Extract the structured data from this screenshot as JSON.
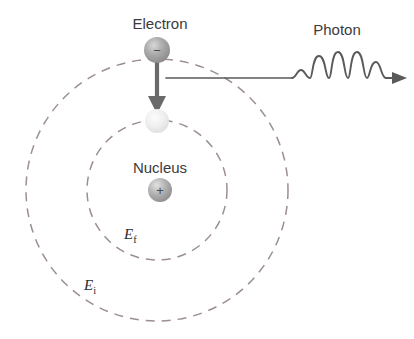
{
  "diagram": {
    "background_color": "#ffffff",
    "orbit_color": "#9c8d97",
    "line_color": "#5a5a5a",
    "text_color": "#3b3b3b",
    "labels": {
      "electron": "Electron",
      "photon": "Photon",
      "nucleus": "Nucleus",
      "energy_final": "E",
      "energy_final_sub": "f",
      "energy_initial": "E",
      "energy_initial_sub": "i"
    },
    "particles": {
      "electron_charge": "−",
      "nucleus_charge": "+"
    },
    "orbits": [
      {
        "name": "initial-orbit",
        "label": "Ei",
        "cx": 157,
        "cy": 190,
        "r": 131
      },
      {
        "name": "final-orbit",
        "label": "Ef",
        "cx": 157,
        "cy": 190,
        "r": 70
      }
    ],
    "geometry": {
      "electron_x": 157,
      "electron_y": 50,
      "electron_r": 13,
      "landing_x": 157,
      "landing_y": 121,
      "landing_r": 12,
      "nucleus_x": 160,
      "nucleus_y": 190,
      "nucleus_r": 12,
      "transition_arrow_from_y": 62,
      "transition_arrow_to_y": 112,
      "photon_line_y": 78,
      "photon_line_start_x": 166,
      "photon_wave_start_x": 292,
      "photon_arrow_end_x": 406
    }
  }
}
